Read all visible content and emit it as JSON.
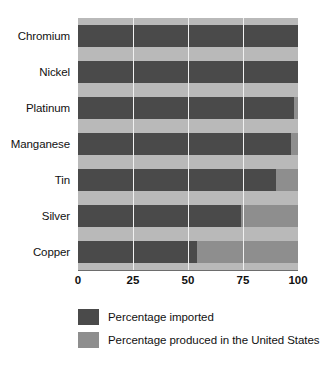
{
  "chart_data": {
    "type": "bar",
    "orientation": "horizontal",
    "stacked": true,
    "title": "",
    "subtitle": "",
    "xlabel": "",
    "ylabel": "",
    "xlim": [
      0,
      100
    ],
    "xticks": [
      "0",
      "25",
      "50",
      "75",
      "100"
    ],
    "xtick_values": [
      0,
      25,
      50,
      75,
      100
    ],
    "grid": true,
    "grid_axis": "x",
    "legend_position": "bottom",
    "categories": [
      "Chromium",
      "Nickel",
      "Platinum",
      "Manganese",
      "Tin",
      "Silver",
      "Copper"
    ],
    "series": [
      {
        "name": "Percentage imported",
        "color": "#4a4a4a",
        "values": [
          100,
          100,
          98,
          97,
          90,
          74,
          54
        ]
      },
      {
        "name": "Percentage produced in the United States",
        "color": "#8e8e8e",
        "values": [
          0,
          0,
          2,
          3,
          10,
          26,
          46
        ]
      }
    ]
  },
  "colors": {
    "imported": "#4a4a4a",
    "produced": "#8e8e8e",
    "plot_background": "#b9b9b9",
    "gridline": "#f1f1f1",
    "axis": "#6d6d6d",
    "text": "#111111"
  },
  "legend": {
    "items": [
      {
        "label": "Percentage imported",
        "color": "#4a4a4a"
      },
      {
        "label": "Percentage produced in the United States",
        "color": "#8e8e8e"
      }
    ]
  }
}
